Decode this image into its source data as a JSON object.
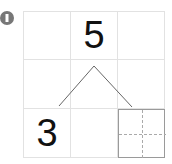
{
  "problem": {
    "marker_label": "1",
    "whole": "5",
    "part_known": "3",
    "part_unknown": ""
  }
}
